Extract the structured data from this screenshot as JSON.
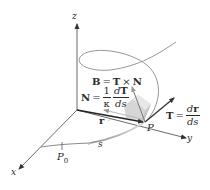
{
  "figure": {
    "axes": {
      "x_label": "x",
      "y_label": "y",
      "z_label": "z"
    },
    "points": {
      "start_point": "P",
      "start_subscript": "0",
      "current_point": "P"
    },
    "arc_length_label": "s",
    "position_vector_label": "r",
    "binormal": {
      "lhs": "B",
      "equals": "=",
      "t": "T",
      "times": "×",
      "n": "N"
    },
    "normal": {
      "lhs": "N",
      "equals": "=",
      "coef_num": "1",
      "coef_den": "κ",
      "num": "dT",
      "num_d": "d",
      "num_v": "T",
      "den": "ds"
    },
    "tangent": {
      "lhs": "T",
      "equals": "=",
      "num_d": "d",
      "num_v": "r",
      "den": "ds"
    },
    "colors": {
      "axis": "#444444",
      "curve": "#8a8a8a",
      "vector": "#333333",
      "normal_vector": "#b8b8b8",
      "plane": "#d9d9d9"
    }
  }
}
